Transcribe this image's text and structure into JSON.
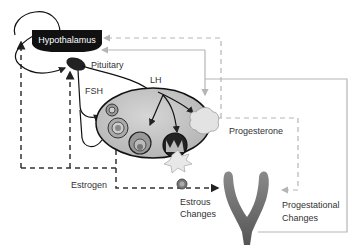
{
  "diagram": {
    "nodes": {
      "hypothalamus": "Hypothalamus",
      "pituitary": "Pituitary"
    },
    "labels": {
      "fsh": "FSH",
      "lh": "LH",
      "progesterone": "Progesterone",
      "estrogen": "Estrogen",
      "estrous_changes_1": "Estrous",
      "estrous_changes_2": "Changes",
      "progestational_changes_1": "Progestational",
      "progestational_changes_2": "Changes"
    },
    "colors": {
      "hypothalamus_fill": "#111111",
      "pituitary_fill": "#222222",
      "ovary_fill": "#c9c9c9",
      "corpus_luteum_fill": "#e3e3e3",
      "uterus_fill": "#6f6f6f",
      "progesterone_line": "#b5b5b5",
      "estrogen_line": "#333333"
    }
  }
}
